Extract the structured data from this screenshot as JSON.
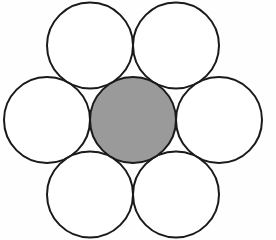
{
  "figure": {
    "name": "hexagonal-close-packing",
    "width": 276,
    "height": 240,
    "background_color": "#fefefe"
  },
  "style": {
    "stroke_color": "#1a1a1a",
    "stroke_width": 2.0,
    "center_fill": "#9a9a9a",
    "outer_fill": "#ffffff"
  },
  "chart_data": {
    "type": "scatter",
    "xlabel": "",
    "ylabel": "",
    "xlim": [
      0,
      276
    ],
    "ylim": [
      0,
      240
    ],
    "grid": false,
    "legend": "none",
    "radius": 43,
    "circles": [
      {
        "id": "center",
        "label": "center circle",
        "cx": 133,
        "cy": 120,
        "r": 43,
        "fill": "#9a9a9a",
        "stroke": "#1a1a1a"
      },
      {
        "id": "top-left",
        "label": "top left circle",
        "cx": 90,
        "cy": 45.5,
        "r": 43,
        "fill": "#ffffff",
        "stroke": "#1a1a1a"
      },
      {
        "id": "top-right",
        "label": "top right circle",
        "cx": 176,
        "cy": 45.5,
        "r": 43,
        "fill": "#ffffff",
        "stroke": "#1a1a1a"
      },
      {
        "id": "middle-left",
        "label": "middle left circle",
        "cx": 47,
        "cy": 120,
        "r": 43,
        "fill": "#ffffff",
        "stroke": "#1a1a1a"
      },
      {
        "id": "middle-right",
        "label": "middle right circle",
        "cx": 219,
        "cy": 120,
        "r": 43,
        "fill": "#ffffff",
        "stroke": "#1a1a1a"
      },
      {
        "id": "bottom-left",
        "label": "bottom left circle",
        "cx": 90,
        "cy": 194.5,
        "r": 43,
        "fill": "#ffffff",
        "stroke": "#1a1a1a"
      },
      {
        "id": "bottom-right",
        "label": "bottom right circle",
        "cx": 176,
        "cy": 194.5,
        "r": 43,
        "fill": "#ffffff",
        "stroke": "#1a1a1a"
      }
    ]
  }
}
